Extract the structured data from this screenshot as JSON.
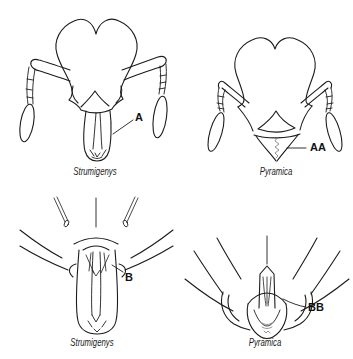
{
  "figure": {
    "background": "#ffffff",
    "line_color": "#1c1c1c",
    "serration_color": "#777777",
    "panels": [
      {
        "id": "strumigenys-head-frontal",
        "label": "A",
        "caption": "Strumigenys"
      },
      {
        "id": "pyramica-head-frontal",
        "label": "AA",
        "caption": "Pyramica"
      },
      {
        "id": "strumigenys-mandible-closeup",
        "label": "B",
        "caption": "Strumigenys"
      },
      {
        "id": "pyramica-mandible-closeup",
        "label": "BB",
        "caption": "Pyramica"
      }
    ]
  }
}
